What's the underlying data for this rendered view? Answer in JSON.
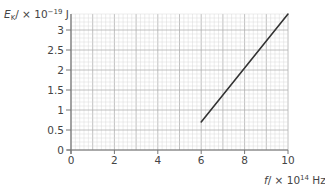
{
  "chart_data": {
    "type": "line",
    "title": "",
    "xlabel": "f / × 10^14 Hz",
    "ylabel": "E_K / × 10^-19 J",
    "xlim": [
      0,
      10
    ],
    "ylim": [
      0,
      3.4
    ],
    "x_ticks": [
      0,
      2,
      4,
      6,
      8,
      10
    ],
    "x_tick_labels": [
      "0",
      "2",
      "4",
      "6",
      "8",
      "10"
    ],
    "y_ticks": [
      0,
      0.5,
      1,
      1.5,
      2,
      2.5,
      3
    ],
    "y_tick_labels": [
      "0",
      "0.5",
      "1",
      "1.5",
      "2",
      "2.5",
      "3"
    ],
    "grid": true,
    "legend": null,
    "series": [
      {
        "name": "kinetic energy vs frequency",
        "x": [
          6,
          10
        ],
        "y": [
          0.7,
          3.4
        ]
      }
    ]
  },
  "axis_labels": {
    "y_main": "E",
    "y_sub": "K",
    "y_rest": "/ × 10",
    "y_exp": "−19",
    "y_unit": " J",
    "x_main": "f",
    "x_rest": "/ × 10",
    "x_exp": "14",
    "x_unit": " Hz"
  },
  "colors": {
    "line": "#333333",
    "grid_minor": "#d8d8d8",
    "grid_major": "#b0b0b0",
    "axis": "#777777"
  }
}
